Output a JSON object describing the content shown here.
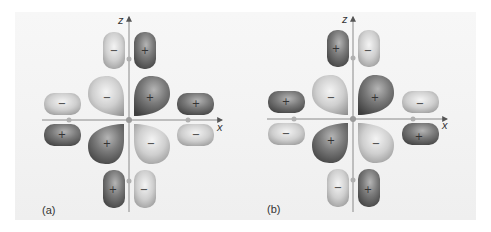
{
  "figure": {
    "colors": {
      "background": "#f2f2f2",
      "positive_lobe": "#6e6e6e",
      "negative_lobe": "#c8c8c8",
      "axis": "#888888"
    },
    "panels": [
      {
        "label": "(a)",
        "axes": {
          "x": "x",
          "z": "z"
        },
        "lobes": {
          "top_left": "−",
          "top_right": "+",
          "upper_left_big": "−",
          "upper_right_big": "+",
          "lower_left_big": "+",
          "lower_right_big": "−",
          "left_upper": "−",
          "left_lower": "+",
          "right_upper": "+",
          "right_lower": "−",
          "bottom_left": "+",
          "bottom_right": "−"
        }
      },
      {
        "label": "(b)",
        "axes": {
          "x": "x",
          "z": "z"
        },
        "lobes": {
          "top_left": "+",
          "top_right": "−",
          "upper_left_big": "−",
          "upper_right_big": "+",
          "lower_left_big": "+",
          "lower_right_big": "−",
          "left_upper": "+",
          "left_lower": "−",
          "right_upper": "−",
          "right_lower": "+",
          "bottom_left": "−",
          "bottom_right": "+"
        }
      }
    ]
  }
}
